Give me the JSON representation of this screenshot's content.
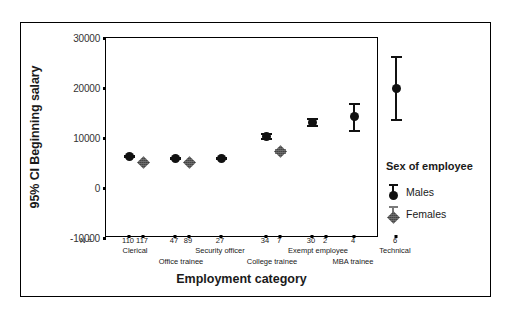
{
  "chart_data": {
    "type": "scatter",
    "title": "",
    "subtitle": "",
    "xlabel": "Employment category",
    "ylabel": "95% CI Beginning salary",
    "ylim": [
      -10000,
      30000
    ],
    "ytick_labels": [
      "30000",
      "20000",
      "10000",
      "0",
      "-10000"
    ],
    "ytick_values": [
      30000,
      20000,
      10000,
      0,
      -10000
    ],
    "grid": false,
    "legend_position": "right",
    "n_prefix": "N =",
    "categories": [
      "Clerical",
      "Office trainee",
      "Security officer",
      "College trainee",
      "Exempt employee",
      "MBA trainee",
      "Technical"
    ],
    "category_row1": [
      "Clerical",
      "Security officer",
      "Exempt employee",
      "Technical"
    ],
    "category_row2": [
      "Office trainee",
      "College trainee",
      "MBA trainee"
    ],
    "series": [
      {
        "name": "Males",
        "color": "#111111",
        "marker": "circle",
        "points": [
          {
            "category": "Clerical",
            "n": 110,
            "mean": 6300,
            "lower": 5950,
            "upper": 6650
          },
          {
            "category": "Office trainee",
            "n": 47,
            "mean": 5950,
            "lower": 5650,
            "upper": 6250
          },
          {
            "category": "Security officer",
            "n": 27,
            "mean": 5900,
            "lower": 5650,
            "upper": 6150
          },
          {
            "category": "College trainee",
            "n": 34,
            "mean": 10300,
            "lower": 9600,
            "upper": 11000
          },
          {
            "category": "Exempt employee",
            "n": 30,
            "mean": 13200,
            "lower": 12300,
            "upper": 14100
          },
          {
            "category": "MBA trainee",
            "n": 4,
            "mean": 14300,
            "lower": 11200,
            "upper": 17000
          },
          {
            "category": "Technical",
            "n": 6,
            "mean": 20000,
            "lower": 13500,
            "upper": 26500
          }
        ]
      },
      {
        "name": "Females",
        "color": "#6f6f6f",
        "marker": "diamond",
        "points": [
          {
            "category": "Clerical",
            "n": 117,
            "mean": 5100,
            "lower": 4900,
            "upper": 5300
          },
          {
            "category": "Office trainee",
            "n": 89,
            "mean": 5200,
            "lower": 5000,
            "upper": 5400
          },
          {
            "category": "College trainee",
            "n": 7,
            "mean": 7300,
            "lower": 6750,
            "upper": 7850
          },
          {
            "category": "MBA trainee",
            "n": 2,
            "mean": 11000,
            "lower": -500,
            "upper": 23500
          }
        ]
      }
    ],
    "n_row": [
      "110",
      "117",
      "47",
      "89",
      "27",
      "34",
      "7",
      "30",
      "2",
      "4",
      "6"
    ]
  },
  "legend": {
    "title": "Sex of employee",
    "entries": [
      {
        "label": "Males",
        "icon": "male-errorbar-circle-icon"
      },
      {
        "label": "Females",
        "icon": "female-errorbar-diamond-icon"
      }
    ]
  }
}
